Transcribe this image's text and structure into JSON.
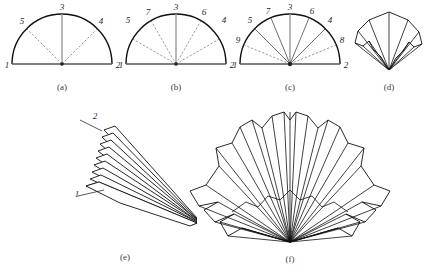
{
  "figure": {
    "background_color": "#ffffff",
    "ink_color": "#111111",
    "panels": [
      {
        "id": "a",
        "caption": "(a)",
        "type": "semicircle-crease-pattern",
        "vertex_labels": [
          "1",
          "2",
          "3",
          "4",
          "5"
        ],
        "sector_count": 4,
        "solid_creases": 1,
        "dashed_creases": 2
      },
      {
        "id": "b",
        "caption": "(b)",
        "type": "semicircle-crease-pattern",
        "vertex_labels": [
          "1",
          "2",
          "3",
          "4",
          "5",
          "6",
          "7"
        ],
        "sector_count": 6,
        "solid_creases": 1,
        "dashed_creases": 4
      },
      {
        "id": "c",
        "caption": "(c)",
        "type": "semicircle-crease-pattern",
        "vertex_labels": [
          "1",
          "2",
          "3",
          "4",
          "5",
          "6",
          "7",
          "8",
          "9"
        ],
        "sector_count": 8,
        "solid_creases": 5,
        "dashed_creases": 2
      },
      {
        "id": "d",
        "caption": "(d)",
        "type": "partially-folded-fan",
        "vertex_labels": [],
        "pleat_count": 8
      },
      {
        "id": "e",
        "caption": "(e)",
        "type": "collapsed-pleat-stack",
        "vertex_labels": [
          "1",
          "2"
        ],
        "pleat_count": 9
      },
      {
        "id": "f",
        "caption": "(f)",
        "type": "opened-fan",
        "vertex_labels": [],
        "pleat_count": 14
      }
    ]
  }
}
